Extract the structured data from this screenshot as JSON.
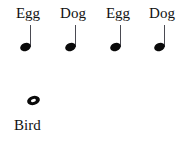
{
  "canvas": {
    "width": 188,
    "height": 142,
    "background_color": "#ffffff",
    "ink_color": "#0a0a0a",
    "stem_color": "#4a4a52"
  },
  "rhythm_chart": {
    "title_text": "",
    "top_row": {
      "description": "four one-syllable words each paired with a quarter note",
      "items": [
        {
          "word": "Egg",
          "note_type": "quarter-note",
          "label_center_x": 28,
          "note_x": 20,
          "beats": 1
        },
        {
          "word": "Dog",
          "note_type": "quarter-note",
          "label_center_x": 73,
          "note_x": 65,
          "beats": 1
        },
        {
          "word": "Egg",
          "note_type": "quarter-note",
          "label_center_x": 118,
          "note_x": 110,
          "beats": 1
        },
        {
          "word": "Dog",
          "note_type": "quarter-note",
          "label_center_x": 162,
          "note_x": 154,
          "beats": 1
        }
      ]
    },
    "bottom_row": {
      "description": "one word paired with a whole note",
      "items": [
        {
          "word": "Bird",
          "note_type": "whole-note",
          "label_x": 14,
          "note_x": 27,
          "beats": 4
        }
      ]
    }
  }
}
